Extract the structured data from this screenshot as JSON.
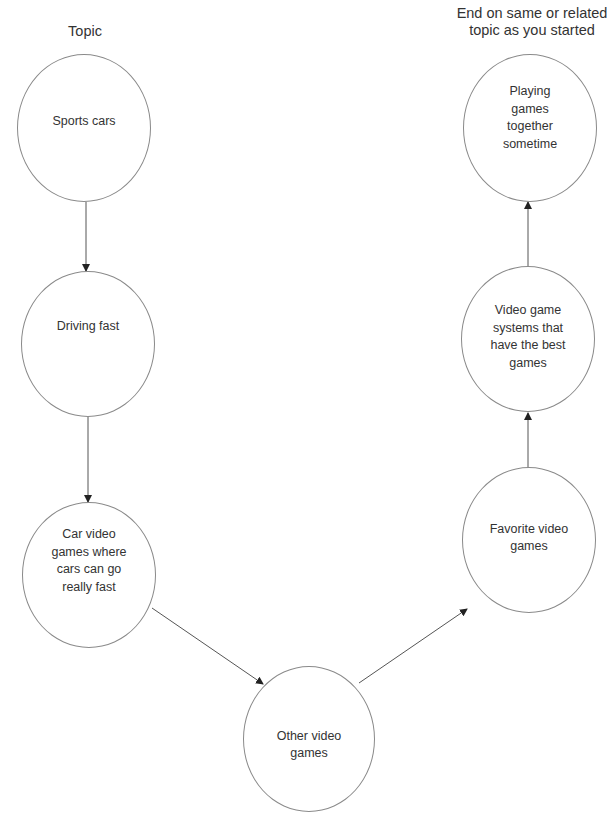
{
  "headings": {
    "start": "Topic",
    "end_line1": "End on same or related",
    "end_line2": "topic as you started"
  },
  "nodes": [
    {
      "id": "sports-cars",
      "lines": [
        "Sports cars"
      ],
      "cx": 84,
      "cy": 128,
      "rx": 67,
      "ry": 74,
      "label_dy": -6
    },
    {
      "id": "driving-fast",
      "lines": [
        "Driving fast"
      ],
      "cx": 88,
      "cy": 344,
      "rx": 67,
      "ry": 73,
      "label_dy": -17
    },
    {
      "id": "car-video-games",
      "lines": [
        "Car video",
        "games where",
        "cars can go",
        "really fast"
      ],
      "cx": 89,
      "cy": 575,
      "rx": 67,
      "ry": 73,
      "label_dy": -14
    },
    {
      "id": "other-video-games",
      "lines": [
        "Other video",
        "games"
      ],
      "cx": 309,
      "cy": 739,
      "rx": 66,
      "ry": 73,
      "label_dy": 6
    },
    {
      "id": "favorite-video-games",
      "lines": [
        "Favorite video",
        "games"
      ],
      "cx": 529,
      "cy": 540,
      "rx": 67,
      "ry": 73,
      "label_dy": -2
    },
    {
      "id": "video-game-systems",
      "lines": [
        "Video game",
        "systems that",
        "have the best",
        "games"
      ],
      "cx": 528,
      "cy": 339,
      "rx": 67,
      "ry": 73,
      "label_dy": -2
    },
    {
      "id": "playing-games-together",
      "lines": [
        "Playing",
        "games",
        "together",
        "sometime"
      ],
      "cx": 530,
      "cy": 128,
      "rx": 67,
      "ry": 74,
      "label_dy": -10
    }
  ],
  "edges": [
    {
      "from": "sports-cars",
      "to": "driving-fast",
      "x1": 86,
      "y1": 202,
      "x2": 86,
      "y2": 271
    },
    {
      "from": "driving-fast",
      "to": "car-video-games",
      "x1": 88,
      "y1": 417,
      "x2": 88,
      "y2": 502
    },
    {
      "from": "car-video-games",
      "to": "other-video-games",
      "x1": 152,
      "y1": 608,
      "x2": 263,
      "y2": 684
    },
    {
      "from": "other-video-games",
      "to": "favorite-video-games",
      "x1": 359,
      "y1": 683,
      "x2": 467,
      "y2": 609
    },
    {
      "from": "favorite-video-games",
      "to": "video-game-systems",
      "x1": 528,
      "y1": 500,
      "x2": 528,
      "y2": 413
    },
    {
      "from": "video-game-systems",
      "to": "playing-games-together",
      "x1": 528,
      "y1": 269,
      "x2": 528,
      "y2": 202
    }
  ],
  "style": {
    "line_color": "#555555",
    "node_border": "#8a8a8a",
    "text_color": "#333333"
  }
}
